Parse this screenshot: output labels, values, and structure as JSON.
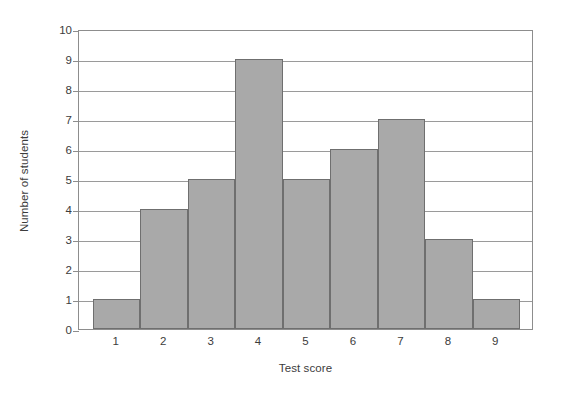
{
  "chart_data": {
    "type": "bar",
    "title": "",
    "xlabel": "Test score",
    "ylabel": "Number of students",
    "categories": [
      "1",
      "2",
      "3",
      "4",
      "5",
      "6",
      "7",
      "8",
      "9"
    ],
    "values": [
      1,
      4,
      5,
      9,
      5,
      6,
      7,
      3,
      1
    ],
    "ylim": [
      0,
      10
    ],
    "yticks": [
      "0",
      "1",
      "2",
      "3",
      "4",
      "5",
      "6",
      "7",
      "8",
      "9",
      "10"
    ],
    "ytick_values": [
      0,
      1,
      2,
      3,
      4,
      5,
      6,
      7,
      8,
      9,
      10
    ],
    "grid": true,
    "grid_axis": "y",
    "legend": false,
    "bar_color": "#a9a9a9",
    "bar_edge_color": "#6f6f6f",
    "axis_color": "#8d8d8d",
    "grid_color": "#9a9a9a",
    "text_color": "#3c3c3c",
    "background": "#ffffff"
  }
}
